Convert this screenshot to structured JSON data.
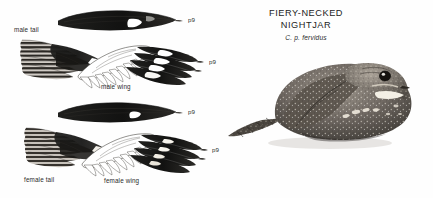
{
  "plate": {
    "kind": "field-guide-plate",
    "background_color": "#ffffff",
    "ink_color": "#1a1a1a"
  },
  "title": {
    "common_name_line1": "FIERY-NECKED",
    "common_name_line2": "NIGHTJAR",
    "scientific_name": "C. p. fervidus"
  },
  "figures": [
    {
      "id": "male-tail",
      "label": "male tail",
      "sex": "male",
      "part": "tail"
    },
    {
      "id": "male-wing",
      "label": "male wing",
      "sex": "male",
      "part": "wing"
    },
    {
      "id": "female-tail",
      "label": "female tail",
      "sex": "female",
      "part": "tail"
    },
    {
      "id": "female-wing",
      "label": "female wing",
      "sex": "female",
      "part": "wing"
    }
  ],
  "feather_callouts": [
    {
      "id": "callout-male-tail",
      "text": "p9"
    },
    {
      "id": "callout-male-wing",
      "text": "p9"
    },
    {
      "id": "callout-female-tail",
      "text": "p9"
    },
    {
      "id": "callout-female-wing",
      "text": "p9"
    }
  ],
  "bird_illustration": {
    "name": "fiery-necked-nightjar-perched",
    "pose": "crouched perched, facing right",
    "rendering": "grayscale pencil illustration"
  }
}
